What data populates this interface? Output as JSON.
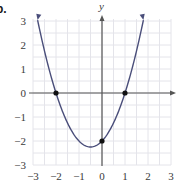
{
  "part_label": "b.",
  "chart_data": {
    "type": "line",
    "title": "",
    "xlabel": "",
    "ylabel": "y",
    "xlim": [
      -3,
      3
    ],
    "ylim": [
      -3,
      3
    ],
    "grid": true,
    "x_ticks": [
      -3,
      -2,
      -1,
      0,
      1,
      2,
      3
    ],
    "y_ticks": [
      -3,
      -2,
      -1,
      0,
      1,
      2,
      3
    ],
    "x_tick_labels": [
      "−3",
      "−2",
      "−1",
      "0",
      "1",
      "2",
      "3"
    ],
    "y_tick_labels": [
      "−3",
      "−2",
      "−1",
      "0",
      "1",
      "2",
      "3"
    ],
    "series": [
      {
        "name": "parabola",
        "function": "y = x^2 + x - 2",
        "x": [
          -2.8,
          -2.5,
          -2,
          -1.5,
          -1,
          -0.5,
          0,
          0.5,
          1,
          1.5,
          1.8
        ],
        "y": [
          3.04,
          1.75,
          0,
          -1.25,
          -2,
          -2.25,
          -2,
          -1.25,
          0,
          1.75,
          3.04
        ],
        "arrows_at_ends": true,
        "color": "#4a4e7a"
      }
    ],
    "marked_points": [
      {
        "x": -2,
        "y": 0
      },
      {
        "x": 1,
        "y": 0
      },
      {
        "x": 0,
        "y": -2
      }
    ],
    "colors": {
      "curve": "#4a4e7a",
      "axis": "#555555",
      "grid": "#e4e4ea",
      "point": "#111111"
    }
  }
}
